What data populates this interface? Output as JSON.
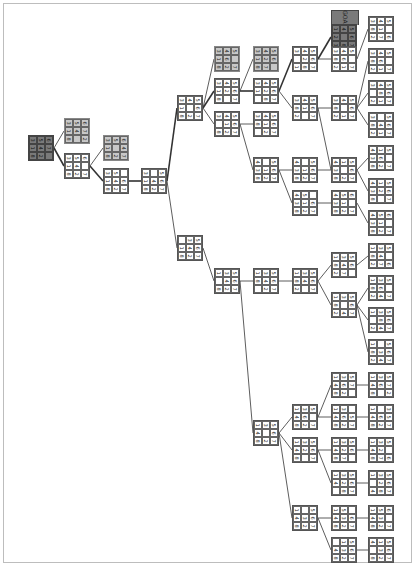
{
  "diagram": {
    "type": "search-tree",
    "puzzle": "8-puzzle",
    "goal_label": "GOAL",
    "colors": {
      "root": "#7a7a7a",
      "visited": "#c8c8c8",
      "normal": "#ffffff",
      "edge": "#333333",
      "frame": "#bdbdbd"
    }
  },
  "nodes": [
    {
      "id": "n0",
      "x": 28,
      "y": 135,
      "style": "dark",
      "cells": [
        "3",
        "5",
        "6",
        "1",
        "4",
        "7",
        "8",
        "2",
        ""
      ]
    },
    {
      "id": "n1",
      "x": 64,
      "y": 118,
      "style": "gray",
      "cells": [
        "3",
        "5",
        "6",
        "1",
        "4",
        "7",
        "8",
        "",
        "2"
      ]
    },
    {
      "id": "n2",
      "x": 64,
      "y": 153,
      "style": "normal",
      "cells": [
        "3",
        "5",
        "6",
        "1",
        "4",
        "",
        "8",
        "2",
        "7"
      ]
    },
    {
      "id": "n3",
      "x": 103,
      "y": 135,
      "style": "gray",
      "cells": [
        "3",
        "5",
        "6",
        "1",
        "",
        "4",
        "8",
        "2",
        "7"
      ]
    },
    {
      "id": "n4",
      "x": 103,
      "y": 168,
      "style": "normal",
      "cells": [
        "3",
        "5",
        "",
        "1",
        "4",
        "6",
        "8",
        "2",
        "7"
      ]
    },
    {
      "id": "n5",
      "x": 141,
      "y": 168,
      "style": "normal",
      "cells": [
        "3",
        "",
        "5",
        "1",
        "4",
        "6",
        "8",
        "2",
        "7"
      ]
    },
    {
      "id": "n6",
      "x": 177,
      "y": 95,
      "style": "normal",
      "cells": [
        "3",
        "4",
        "5",
        "1",
        "",
        "6",
        "8",
        "2",
        "7"
      ]
    },
    {
      "id": "n7",
      "x": 177,
      "y": 235,
      "style": "normal",
      "cells": [
        "",
        "3",
        "5",
        "1",
        "4",
        "6",
        "8",
        "2",
        "7"
      ]
    },
    {
      "id": "n8",
      "x": 214,
      "y": 46,
      "style": "gray",
      "cells": [
        "3",
        "4",
        "5",
        "1",
        "6",
        "",
        "8",
        "2",
        "7"
      ]
    },
    {
      "id": "n9",
      "x": 214,
      "y": 78,
      "style": "normal",
      "cells": [
        "3",
        "4",
        "5",
        "1",
        "2",
        "6",
        "8",
        "",
        "7"
      ]
    },
    {
      "id": "n10",
      "x": 214,
      "y": 111,
      "style": "normal",
      "cells": [
        "3",
        "4",
        "5",
        "",
        "1",
        "6",
        "8",
        "2",
        "7"
      ]
    },
    {
      "id": "n11",
      "x": 253,
      "y": 46,
      "style": "gray",
      "cells": [
        "3",
        "4",
        "5",
        "1",
        "2",
        "6",
        "8",
        "7",
        ""
      ]
    },
    {
      "id": "n12",
      "x": 253,
      "y": 78,
      "style": "normal",
      "cells": [
        "3",
        "4",
        "5",
        "1",
        "2",
        "6",
        "",
        "8",
        "7"
      ]
    },
    {
      "id": "n13",
      "x": 253,
      "y": 111,
      "style": "normal",
      "cells": [
        "3",
        "4",
        "5",
        "8",
        "1",
        "6",
        "",
        "2",
        "7"
      ]
    },
    {
      "id": "n14",
      "x": 253,
      "y": 157,
      "style": "normal",
      "cells": [
        "4",
        "",
        "5",
        "3",
        "1",
        "6",
        "8",
        "2",
        "7"
      ]
    },
    {
      "id": "n15",
      "x": 292,
      "y": 46,
      "style": "normal",
      "cells": [
        "3",
        "4",
        "5",
        "",
        "2",
        "6",
        "1",
        "8",
        "7"
      ]
    },
    {
      "id": "n16",
      "x": 292,
      "y": 95,
      "style": "normal",
      "cells": [
        "3",
        "4",
        "5",
        "8",
        "1",
        "6",
        "2",
        "",
        "7"
      ]
    },
    {
      "id": "n17",
      "x": 292,
      "y": 157,
      "style": "normal",
      "cells": [
        "4",
        "",
        "5",
        "3",
        "1",
        "6",
        "8",
        "2",
        "7"
      ]
    },
    {
      "id": "n18",
      "x": 292,
      "y": 190,
      "style": "normal",
      "cells": [
        "4",
        "5",
        "",
        "3",
        "1",
        "6",
        "8",
        "2",
        "7"
      ]
    },
    {
      "id": "n19",
      "x": 331,
      "y": 10,
      "style": "dark",
      "goal": true,
      "cells": [
        "1",
        "4",
        "5",
        "2",
        "",
        "6",
        "3",
        "8",
        "7"
      ]
    },
    {
      "id": "n20",
      "x": 331,
      "y": 46,
      "style": "normal",
      "cells": [
        "3",
        "4",
        "5",
        "8",
        "6",
        "",
        "2",
        "1",
        "7"
      ]
    },
    {
      "id": "n21",
      "x": 331,
      "y": 95,
      "style": "normal",
      "cells": [
        "3",
        "4",
        "5",
        "8",
        "",
        "6",
        "2",
        "1",
        "7"
      ]
    },
    {
      "id": "n22",
      "x": 331,
      "y": 157,
      "style": "normal",
      "cells": [
        "4",
        "1",
        "5",
        "3",
        "",
        "6",
        "8",
        "2",
        "7"
      ]
    },
    {
      "id": "n23",
      "x": 331,
      "y": 190,
      "style": "normal",
      "cells": [
        "4",
        "5",
        "6",
        "3",
        "1",
        "",
        "8",
        "2",
        "7"
      ]
    },
    {
      "id": "n24",
      "x": 368,
      "y": 16,
      "style": "normal",
      "cells": [
        "3",
        "4",
        "5",
        "8",
        "1",
        "",
        "2",
        "7",
        "6"
      ]
    },
    {
      "id": "n25",
      "x": 368,
      "y": 48,
      "style": "normal",
      "cells": [
        "3",
        "4",
        "5",
        "8",
        "6",
        "",
        "2",
        "1",
        "7"
      ]
    },
    {
      "id": "n26",
      "x": 368,
      "y": 80,
      "style": "normal",
      "cells": [
        "3",
        "4",
        "5",
        "",
        "8",
        "6",
        "2",
        "1",
        "7"
      ]
    },
    {
      "id": "n27",
      "x": 368,
      "y": 112,
      "style": "normal",
      "cells": [
        "3",
        "",
        "5",
        "8",
        "4",
        "6",
        "2",
        "1",
        "7"
      ]
    },
    {
      "id": "n28",
      "x": 368,
      "y": 145,
      "style": "normal",
      "cells": [
        "4",
        "1",
        "5",
        "3",
        "6",
        "",
        "8",
        "2",
        "7"
      ]
    },
    {
      "id": "n29",
      "x": 368,
      "y": 178,
      "style": "normal",
      "cells": [
        "4",
        "1",
        "5",
        "3",
        "2",
        "6",
        "8",
        "",
        "7"
      ]
    },
    {
      "id": "n30",
      "x": 368,
      "y": 210,
      "style": "normal",
      "cells": [
        "4",
        "5",
        "6",
        "3",
        "1",
        "",
        "8",
        "2",
        "7"
      ]
    },
    {
      "id": "n31",
      "x": 214,
      "y": 268,
      "style": "normal",
      "cells": [
        "1",
        "3",
        "5",
        "",
        "4",
        "6",
        "8",
        "2",
        "7"
      ]
    },
    {
      "id": "n32",
      "x": 253,
      "y": 268,
      "style": "normal",
      "cells": [
        "1",
        "3",
        "5",
        "8",
        "4",
        "6",
        "",
        "2",
        "7"
      ]
    },
    {
      "id": "n33",
      "x": 292,
      "y": 268,
      "style": "normal",
      "cells": [
        "1",
        "3",
        "5",
        "8",
        "4",
        "6",
        "2",
        "",
        "7"
      ]
    },
    {
      "id": "n34",
      "x": 331,
      "y": 252,
      "style": "normal",
      "cells": [
        "1",
        "3",
        "5",
        "8",
        "4",
        "6",
        "2",
        "7",
        ""
      ]
    },
    {
      "id": "n35",
      "x": 331,
      "y": 292,
      "style": "normal",
      "cells": [
        "1",
        "3",
        "5",
        "8",
        "",
        "6",
        "2",
        "4",
        "7"
      ]
    },
    {
      "id": "n36",
      "x": 368,
      "y": 243,
      "style": "normal",
      "cells": [
        "1",
        "3",
        "5",
        "8",
        "4",
        "",
        "2",
        "7",
        "6"
      ]
    },
    {
      "id": "n37",
      "x": 368,
      "y": 275,
      "style": "normal",
      "cells": [
        "1",
        "3",
        "5",
        "8",
        "6",
        "",
        "2",
        "4",
        "7"
      ]
    },
    {
      "id": "n38",
      "x": 368,
      "y": 307,
      "style": "normal",
      "cells": [
        "1",
        "3",
        "5",
        "",
        "8",
        "6",
        "2",
        "4",
        "7"
      ]
    },
    {
      "id": "n39",
      "x": 368,
      "y": 339,
      "style": "normal",
      "cells": [
        "1",
        "",
        "5",
        "8",
        "3",
        "6",
        "2",
        "4",
        "7"
      ]
    },
    {
      "id": "n40",
      "x": 253,
      "y": 420,
      "style": "normal",
      "cells": [
        "1",
        "3",
        "5",
        "4",
        "",
        "6",
        "8",
        "2",
        "7"
      ]
    },
    {
      "id": "n41",
      "x": 292,
      "y": 404,
      "style": "normal",
      "cells": [
        "1",
        "3",
        "5",
        "4",
        "6",
        "",
        "8",
        "2",
        "7"
      ]
    },
    {
      "id": "n42",
      "x": 292,
      "y": 437,
      "style": "normal",
      "cells": [
        "1",
        "3",
        "5",
        "4",
        "2",
        "6",
        "8",
        "",
        "7"
      ]
    },
    {
      "id": "n43",
      "x": 292,
      "y": 505,
      "style": "normal",
      "cells": [
        "1",
        "",
        "5",
        "4",
        "3",
        "6",
        "8",
        "2",
        "7"
      ]
    },
    {
      "id": "n44",
      "x": 331,
      "y": 372,
      "style": "normal",
      "cells": [
        "1",
        "3",
        "5",
        "4",
        "6",
        "7",
        "8",
        "2",
        ""
      ]
    },
    {
      "id": "n45",
      "x": 331,
      "y": 404,
      "style": "normal",
      "cells": [
        "1",
        "3",
        "",
        "4",
        "6",
        "5",
        "8",
        "2",
        "7"
      ]
    },
    {
      "id": "n46",
      "x": 331,
      "y": 437,
      "style": "normal",
      "cells": [
        "1",
        "3",
        "5",
        "4",
        "2",
        "6",
        "8",
        "7",
        ""
      ]
    },
    {
      "id": "n47",
      "x": 331,
      "y": 470,
      "style": "normal",
      "cells": [
        "1",
        "3",
        "5",
        "4",
        "2",
        "6",
        "",
        "8",
        "7"
      ]
    },
    {
      "id": "n48",
      "x": 331,
      "y": 505,
      "style": "normal",
      "cells": [
        "1",
        "5",
        "",
        "4",
        "3",
        "6",
        "8",
        "2",
        "7"
      ]
    },
    {
      "id": "n49",
      "x": 331,
      "y": 537,
      "style": "normal",
      "cells": [
        "",
        "1",
        "5",
        "4",
        "3",
        "6",
        "8",
        "2",
        "7"
      ]
    },
    {
      "id": "n50",
      "x": 368,
      "y": 372,
      "style": "normal",
      "cells": [
        "1",
        "3",
        "5",
        "4",
        "6",
        "7",
        "8",
        "",
        "2"
      ]
    },
    {
      "id": "n51",
      "x": 368,
      "y": 404,
      "style": "normal",
      "cells": [
        "1",
        "",
        "3",
        "4",
        "6",
        "5",
        "8",
        "2",
        "7"
      ]
    },
    {
      "id": "n52",
      "x": 368,
      "y": 437,
      "style": "normal",
      "cells": [
        "1",
        "3",
        "5",
        "4",
        "2",
        "",
        "8",
        "7",
        "6"
      ]
    },
    {
      "id": "n53",
      "x": 368,
      "y": 470,
      "style": "normal",
      "cells": [
        "1",
        "3",
        "5",
        "",
        "2",
        "6",
        "4",
        "8",
        "7"
      ]
    },
    {
      "id": "n54",
      "x": 368,
      "y": 505,
      "style": "normal",
      "cells": [
        "1",
        "5",
        "6",
        "4",
        "3",
        "",
        "8",
        "2",
        "7"
      ]
    },
    {
      "id": "n55",
      "x": 368,
      "y": 537,
      "style": "normal",
      "cells": [
        "4",
        "1",
        "5",
        "",
        "3",
        "6",
        "8",
        "2",
        "7"
      ]
    }
  ],
  "edges": [
    [
      "n0",
      "n1"
    ],
    [
      "n0",
      "n2",
      true
    ],
    [
      "n2",
      "n3"
    ],
    [
      "n2",
      "n4",
      true
    ],
    [
      "n4",
      "n5",
      true
    ],
    [
      "n5",
      "n6",
      true
    ],
    [
      "n5",
      "n7"
    ],
    [
      "n6",
      "n8"
    ],
    [
      "n6",
      "n9",
      true
    ],
    [
      "n6",
      "n10"
    ],
    [
      "n9",
      "n11"
    ],
    [
      "n9",
      "n12",
      true
    ],
    [
      "n10",
      "n13"
    ],
    [
      "n10",
      "n14"
    ],
    [
      "n12",
      "n15",
      true
    ],
    [
      "n12",
      "n16"
    ],
    [
      "n14",
      "n17"
    ],
    [
      "n14",
      "n18"
    ],
    [
      "n15",
      "n19",
      true
    ],
    [
      "n15",
      "n20"
    ],
    [
      "n16",
      "n21"
    ],
    [
      "n16",
      "n22"
    ],
    [
      "n17",
      "n22"
    ],
    [
      "n18",
      "n23"
    ],
    [
      "n20",
      "n24"
    ],
    [
      "n21",
      "n25"
    ],
    [
      "n21",
      "n26"
    ],
    [
      "n21",
      "n27"
    ],
    [
      "n22",
      "n28"
    ],
    [
      "n22",
      "n29"
    ],
    [
      "n23",
      "n30"
    ],
    [
      "n7",
      "n31"
    ],
    [
      "n31",
      "n32"
    ],
    [
      "n32",
      "n33"
    ],
    [
      "n33",
      "n34"
    ],
    [
      "n33",
      "n35"
    ],
    [
      "n34",
      "n36"
    ],
    [
      "n35",
      "n37"
    ],
    [
      "n35",
      "n38"
    ],
    [
      "n35",
      "n39"
    ],
    [
      "n31",
      "n40"
    ],
    [
      "n40",
      "n41"
    ],
    [
      "n40",
      "n42"
    ],
    [
      "n40",
      "n43"
    ],
    [
      "n41",
      "n44"
    ],
    [
      "n41",
      "n45"
    ],
    [
      "n42",
      "n46"
    ],
    [
      "n42",
      "n47"
    ],
    [
      "n43",
      "n48"
    ],
    [
      "n43",
      "n49"
    ],
    [
      "n44",
      "n50"
    ],
    [
      "n45",
      "n51"
    ],
    [
      "n46",
      "n52"
    ],
    [
      "n47",
      "n53"
    ],
    [
      "n48",
      "n54"
    ],
    [
      "n49",
      "n55"
    ]
  ]
}
